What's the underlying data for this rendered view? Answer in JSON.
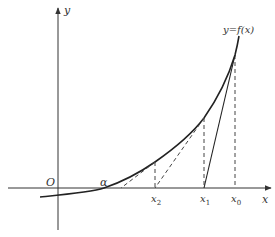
{
  "diagram": {
    "axes": {
      "x_label": "x",
      "y_label": "y",
      "origin_label": "O"
    },
    "curve_label": "y=f(x)",
    "root_label": "α",
    "points": [
      {
        "label": "x",
        "sub": "0"
      },
      {
        "label": "x",
        "sub": "1"
      },
      {
        "label": "x",
        "sub": "2"
      }
    ],
    "colors": {
      "stroke": "#222222",
      "text": "#333333",
      "background": "#ffffff"
    }
  }
}
